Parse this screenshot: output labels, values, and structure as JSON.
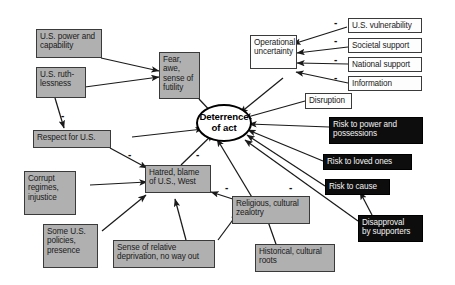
{
  "diagram": {
    "colors": {
      "gray_box": "#b0b0b0",
      "white_box": "#fdfdfd",
      "black_box": "#0d0d0d",
      "edge": "#1a1a1a",
      "background": "#ffffff"
    },
    "center": {
      "label": "Deterrence\nof act",
      "line1": "Deterrence",
      "line2": "of act"
    },
    "nodes": [
      {
        "id": "us-power",
        "label": "U.S. power and capability",
        "style": "gray"
      },
      {
        "id": "us-ruthlessness",
        "label": "U.S. ruth-\nlessness",
        "style": "gray"
      },
      {
        "id": "fear-awe",
        "label": "Fear, awe,\nsense of\nfutility",
        "style": "gray"
      },
      {
        "id": "respect-for-us",
        "label": "Respect for U.S.",
        "style": "gray"
      },
      {
        "id": "corrupt-regimes",
        "label": "Corrupt\nregimes,\ninjustice",
        "style": "gray"
      },
      {
        "id": "some-us-policies",
        "label": "Some U.S.\npolicies,\npresence",
        "style": "gray"
      },
      {
        "id": "hatred-blame",
        "label": "Hatred, blame\nof U.S., West",
        "style": "gray"
      },
      {
        "id": "sense-deprivation",
        "label": "Sense of relative\ndeprivation, no way out",
        "style": "gray"
      },
      {
        "id": "religious-zealotry",
        "label": "Religious, cultural\nzealotry",
        "style": "gray"
      },
      {
        "id": "historical-roots",
        "label": "Historical, cultural\nroots",
        "style": "gray"
      },
      {
        "id": "operational-uncertainty",
        "label": "Operational\nuncertainty",
        "style": "white"
      },
      {
        "id": "us-vulnerability",
        "label": "U.S. vulnerability",
        "style": "white"
      },
      {
        "id": "societal-support",
        "label": "Societal support",
        "style": "white"
      },
      {
        "id": "national-support",
        "label": "National support",
        "style": "white"
      },
      {
        "id": "information",
        "label": "Information",
        "style": "white"
      },
      {
        "id": "disruption",
        "label": "Disruption",
        "style": "white"
      },
      {
        "id": "risk-power",
        "label": "Risk to power and\npossessions",
        "style": "black"
      },
      {
        "id": "risk-loved-ones",
        "label": "Risk to loved ones",
        "style": "black"
      },
      {
        "id": "risk-cause",
        "label": "Risk to cause",
        "style": "black"
      },
      {
        "id": "disapproval",
        "label": "Disapproval\nby supporters",
        "style": "black"
      }
    ],
    "node_labels": {
      "us_power": "U.S. power and capability",
      "us_ruthlessness_l1": "U.S. ruth-",
      "us_ruthlessness_l2": "lessness",
      "fear_l1": "Fear, awe,",
      "fear_l2": "sense of",
      "fear_l3": "futility",
      "respect_for_us": "Respect for U.S.",
      "corrupt_l1": "Corrupt",
      "corrupt_l2": "regimes,",
      "corrupt_l3": "injustice",
      "policies_l1": "Some U.S.",
      "policies_l2": "policies,",
      "policies_l3": "presence",
      "hatred_l1": "Hatred, blame",
      "hatred_l2": "of U.S., West",
      "deprivation_l1": "Sense of relative",
      "deprivation_l2": "deprivation, no way out",
      "zealotry_l1": "Religious, cultural",
      "zealotry_l2": "zealotry",
      "roots_l1": "Historical, cultural",
      "roots_l2": "roots",
      "opuncertainty_l1": "Operational",
      "opuncertainty_l2": "uncertainty",
      "us_vulnerability": "U.S. vulnerability",
      "societal_support": "Societal support",
      "national_support": "National support",
      "information": "Information",
      "disruption": "Disruption",
      "risk_power_l1": "Risk to power and",
      "risk_power_l2": "possessions",
      "risk_loved_ones": "Risk to loved ones",
      "risk_cause": "Risk to cause",
      "disapproval_l1": "Disapproval",
      "disapproval_l2": "by supporters"
    },
    "signs": {
      "minus": "-",
      "list": [
        {
          "for": "us-ruthlessness->respect-for-us",
          "value": "-"
        },
        {
          "for": "respect-for-us->hatred-blame",
          "value": "-"
        },
        {
          "for": "hatred-blame->deterrence",
          "value": "-"
        },
        {
          "for": "religious-zealotry->deterrence",
          "value": "-"
        },
        {
          "for": "religious-zealotry->hatred-blame",
          "value": "-"
        },
        {
          "for": "us-vulnerability->operational-uncertainty",
          "value": "-"
        },
        {
          "for": "societal-support->operational-uncertainty",
          "value": "-"
        },
        {
          "for": "national-support->operational-uncertainty",
          "value": "-"
        },
        {
          "for": "information->operational-uncertainty",
          "value": "-"
        }
      ]
    },
    "edges": [
      {
        "from": "us-power",
        "to": "fear-awe"
      },
      {
        "from": "us-ruthlessness",
        "to": "fear-awe"
      },
      {
        "from": "us-ruthlessness",
        "to": "respect-for-us",
        "sign": "-"
      },
      {
        "from": "fear-awe",
        "to": "deterrence"
      },
      {
        "from": "respect-for-us",
        "to": "deterrence"
      },
      {
        "from": "respect-for-us",
        "to": "hatred-blame",
        "sign": "-"
      },
      {
        "from": "corrupt-regimes",
        "to": "hatred-blame"
      },
      {
        "from": "some-us-policies",
        "to": "hatred-blame"
      },
      {
        "from": "sense-deprivation",
        "to": "hatred-blame"
      },
      {
        "from": "religious-zealotry",
        "to": "hatred-blame",
        "sign": "-"
      },
      {
        "from": "historical-roots",
        "to": "religious-zealotry"
      },
      {
        "from": "sense-deprivation",
        "to": "religious-zealotry"
      },
      {
        "from": "hatred-blame",
        "to": "deterrence",
        "sign": "-"
      },
      {
        "from": "religious-zealotry",
        "to": "deterrence",
        "sign": "-"
      },
      {
        "from": "operational-uncertainty",
        "to": "deterrence"
      },
      {
        "from": "us-vulnerability",
        "to": "operational-uncertainty",
        "sign": "-"
      },
      {
        "from": "societal-support",
        "to": "operational-uncertainty",
        "sign": "-"
      },
      {
        "from": "national-support",
        "to": "operational-uncertainty",
        "sign": "-"
      },
      {
        "from": "information",
        "to": "operational-uncertainty",
        "sign": "-"
      },
      {
        "from": "disruption",
        "to": "deterrence"
      },
      {
        "from": "risk-power",
        "to": "deterrence"
      },
      {
        "from": "risk-loved-ones",
        "to": "deterrence"
      },
      {
        "from": "risk-cause",
        "to": "deterrence"
      },
      {
        "from": "disapproval",
        "to": "deterrence"
      },
      {
        "from": "disapproval",
        "to": "risk-cause"
      }
    ]
  }
}
